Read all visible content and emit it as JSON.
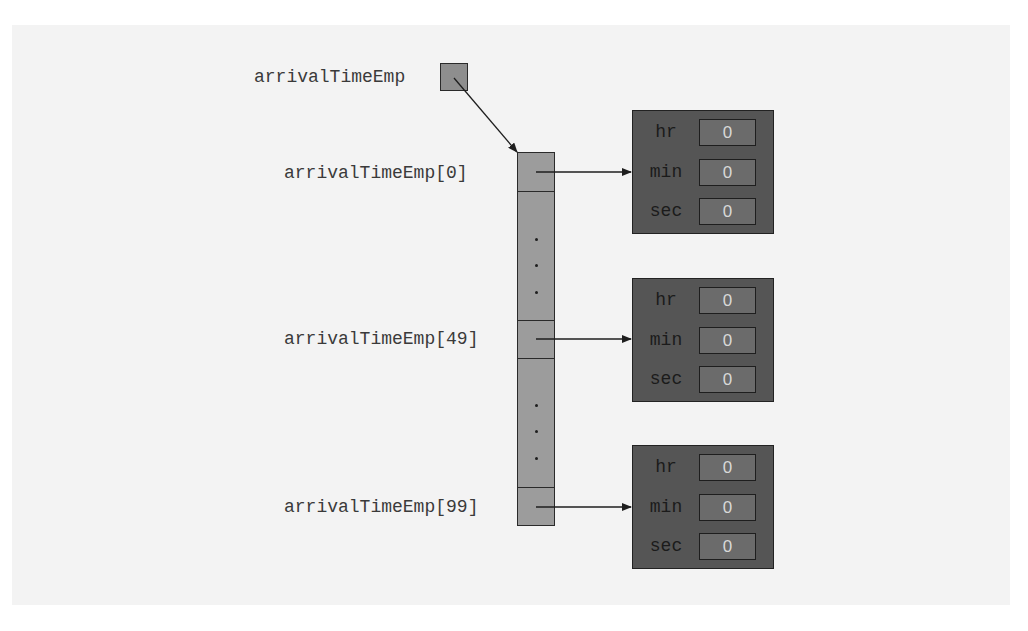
{
  "diagram": {
    "type": "array-of-objects-memory-layout",
    "reference_variable": {
      "name": "arrivalTimeEmp"
    },
    "array": {
      "cells": [
        {
          "label": "arrivalTimeEmp[0]",
          "index": 0
        },
        {
          "label": "arrivalTimeEmp[49]",
          "index": 49
        },
        {
          "label": "arrivalTimeEmp[99]",
          "index": 99
        }
      ],
      "ellipsis": "..."
    },
    "objects": [
      {
        "fields": [
          {
            "name": "hr",
            "value": "0"
          },
          {
            "name": "min",
            "value": "0"
          },
          {
            "name": "sec",
            "value": "0"
          }
        ]
      },
      {
        "fields": [
          {
            "name": "hr",
            "value": "0"
          },
          {
            "name": "min",
            "value": "0"
          },
          {
            "name": "sec",
            "value": "0"
          }
        ]
      },
      {
        "fields": [
          {
            "name": "hr",
            "value": "0"
          },
          {
            "name": "min",
            "value": "0"
          },
          {
            "name": "sec",
            "value": "0"
          }
        ]
      }
    ],
    "colors": {
      "panel_bg": "#f3f3f3",
      "array_fill": "#9c9c9c",
      "object_fill": "#555555",
      "field_fill": "#6b6b6b",
      "field_text": "#d8d8d8",
      "stroke": "#2a2a2a"
    }
  }
}
